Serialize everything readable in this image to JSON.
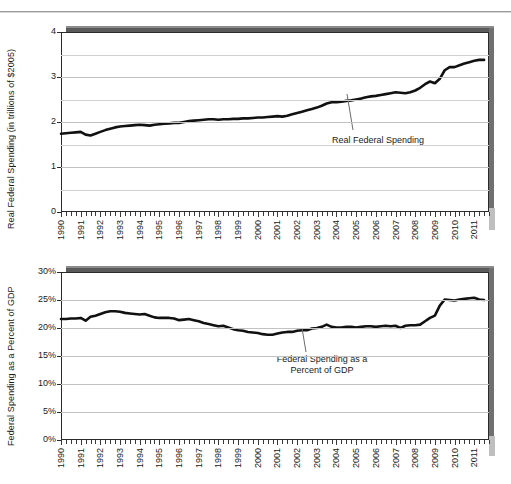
{
  "page": {
    "divider": "horizontal-rule"
  },
  "chart_data": [
    {
      "id": "real-federal-spending",
      "type": "line",
      "title": "",
      "xlabel": "",
      "ylabel": "Real Federal Spending (in trillions of $2005)",
      "ylim": [
        0,
        4
      ],
      "yticks": [
        0,
        1,
        2,
        3,
        4
      ],
      "ytick_labels": [
        "0",
        "1",
        "2",
        "3",
        "4"
      ],
      "gridlines": [
        0.5,
        1,
        1.5,
        2,
        2.5,
        3,
        3.5
      ],
      "grid": true,
      "legend": "none",
      "annotation": "Real Federal Spending",
      "xlim": [
        1990,
        2011.75
      ],
      "xtick_labels": [
        "1990",
        "1991",
        "1992",
        "1993",
        "1994",
        "1995",
        "1996",
        "1997",
        "1998",
        "1999",
        "2000",
        "2001",
        "2002",
        "2003",
        "2004",
        "2005",
        "2006",
        "2007",
        "2008",
        "2009",
        "2010",
        "2011"
      ],
      "minor_ticks_per_year": 4,
      "series": [
        {
          "name": "Real Federal Spending",
          "units": "trillions of 2005 dollars",
          "x": [
            1990.0,
            1990.25,
            1990.5,
            1990.75,
            1991.0,
            1991.25,
            1991.5,
            1991.75,
            1992.0,
            1992.25,
            1992.5,
            1992.75,
            1993.0,
            1993.25,
            1993.5,
            1993.75,
            1994.0,
            1994.25,
            1994.5,
            1994.75,
            1995.0,
            1995.25,
            1995.5,
            1995.75,
            1996.0,
            1996.25,
            1996.5,
            1996.75,
            1997.0,
            1997.25,
            1997.5,
            1997.75,
            1998.0,
            1998.25,
            1998.5,
            1998.75,
            1999.0,
            1999.25,
            1999.5,
            1999.75,
            2000.0,
            2000.25,
            2000.5,
            2000.75,
            2001.0,
            2001.25,
            2001.5,
            2001.75,
            2002.0,
            2002.25,
            2002.5,
            2002.75,
            2003.0,
            2003.25,
            2003.5,
            2003.75,
            2004.0,
            2004.25,
            2004.5,
            2004.75,
            2005.0,
            2005.25,
            2005.5,
            2005.75,
            2006.0,
            2006.25,
            2006.5,
            2006.75,
            2007.0,
            2007.25,
            2007.5,
            2007.75,
            2008.0,
            2008.25,
            2008.5,
            2008.75,
            2009.0,
            2009.25,
            2009.5,
            2009.75,
            2010.0,
            2010.25,
            2010.5,
            2010.75,
            2011.0,
            2011.25,
            2011.5
          ],
          "y": [
            1.74,
            1.75,
            1.76,
            1.77,
            1.78,
            1.72,
            1.7,
            1.74,
            1.78,
            1.82,
            1.85,
            1.88,
            1.9,
            1.91,
            1.92,
            1.93,
            1.94,
            1.93,
            1.92,
            1.94,
            1.95,
            1.96,
            1.97,
            1.98,
            1.98,
            2.0,
            2.02,
            2.03,
            2.04,
            2.05,
            2.06,
            2.06,
            2.05,
            2.06,
            2.06,
            2.07,
            2.07,
            2.08,
            2.08,
            2.09,
            2.1,
            2.1,
            2.11,
            2.12,
            2.13,
            2.12,
            2.14,
            2.17,
            2.2,
            2.23,
            2.26,
            2.29,
            2.32,
            2.36,
            2.41,
            2.44,
            2.44,
            2.45,
            2.47,
            2.48,
            2.5,
            2.52,
            2.55,
            2.57,
            2.58,
            2.6,
            2.62,
            2.64,
            2.66,
            2.65,
            2.64,
            2.66,
            2.7,
            2.76,
            2.84,
            2.9,
            2.86,
            2.96,
            3.15,
            3.22,
            3.22,
            3.26,
            3.3,
            3.33,
            3.36,
            3.38,
            3.38
          ]
        }
      ]
    },
    {
      "id": "federal-spending-percent-gdp",
      "type": "line",
      "title": "",
      "xlabel": "",
      "ylabel": "Federal Spending as a Percent of GDP",
      "ylim": [
        0,
        30
      ],
      "yticks": [
        0,
        5,
        10,
        15,
        20,
        25,
        30
      ],
      "ytick_labels": [
        "0%",
        "5%",
        "10%",
        "15%",
        "20%",
        "25%",
        "30%"
      ],
      "gridlines": [
        5,
        10,
        15,
        20,
        25
      ],
      "grid": true,
      "legend": "none",
      "annotation_line1": "Federal Spending as a",
      "annotation_line2": "Percent of GDP",
      "xlim": [
        1990,
        2011.75
      ],
      "xtick_labels": [
        "1990",
        "1991",
        "1992",
        "1993",
        "1994",
        "1995",
        "1996",
        "1997",
        "1998",
        "1999",
        "2000",
        "2001",
        "2002",
        "2003",
        "2004",
        "2005",
        "2006",
        "2007",
        "2008",
        "2009",
        "2010",
        "2011"
      ],
      "minor_ticks_per_year": 4,
      "series": [
        {
          "name": "Federal Spending as a Percent of GDP",
          "units": "percent of GDP",
          "x": [
            1990.0,
            1990.25,
            1990.5,
            1990.75,
            1991.0,
            1991.25,
            1991.5,
            1991.75,
            1992.0,
            1992.25,
            1992.5,
            1992.75,
            1993.0,
            1993.25,
            1993.5,
            1993.75,
            1994.0,
            1994.25,
            1994.5,
            1994.75,
            1995.0,
            1995.25,
            1995.5,
            1995.75,
            1996.0,
            1996.25,
            1996.5,
            1996.75,
            1997.0,
            1997.25,
            1997.5,
            1997.75,
            1998.0,
            1998.25,
            1998.5,
            1998.75,
            1999.0,
            1999.25,
            1999.5,
            1999.75,
            2000.0,
            2000.25,
            2000.5,
            2000.75,
            2001.0,
            2001.25,
            2001.5,
            2001.75,
            2002.0,
            2002.25,
            2002.5,
            2002.75,
            2003.0,
            2003.25,
            2003.5,
            2003.75,
            2004.0,
            2004.25,
            2004.5,
            2004.75,
            2005.0,
            2005.25,
            2005.5,
            2005.75,
            2006.0,
            2006.25,
            2006.5,
            2006.75,
            2007.0,
            2007.25,
            2007.5,
            2007.75,
            2008.0,
            2008.25,
            2008.5,
            2008.75,
            2009.0,
            2009.25,
            2009.5,
            2009.75,
            2010.0,
            2010.25,
            2010.5,
            2010.75,
            2011.0,
            2011.25,
            2011.5
          ],
          "y": [
            21.6,
            21.6,
            21.7,
            21.7,
            21.8,
            21.3,
            22.0,
            22.2,
            22.5,
            22.8,
            23.0,
            23.0,
            22.9,
            22.7,
            22.6,
            22.5,
            22.4,
            22.5,
            22.2,
            21.9,
            21.8,
            21.8,
            21.8,
            21.7,
            21.4,
            21.5,
            21.6,
            21.4,
            21.2,
            20.9,
            20.7,
            20.5,
            20.3,
            20.4,
            20.1,
            19.8,
            19.6,
            19.5,
            19.3,
            19.2,
            19.1,
            18.9,
            18.8,
            18.8,
            19.0,
            19.2,
            19.3,
            19.3,
            19.5,
            19.6,
            19.6,
            19.9,
            20.0,
            20.2,
            20.6,
            20.2,
            20.1,
            20.1,
            20.2,
            20.2,
            20.1,
            20.2,
            20.3,
            20.3,
            20.2,
            20.3,
            20.4,
            20.3,
            20.4,
            20.0,
            20.4,
            20.5,
            20.5,
            20.6,
            21.2,
            21.8,
            22.2,
            24.0,
            25.1,
            25.0,
            24.9,
            25.1,
            25.2,
            25.3,
            25.4,
            25.1,
            25.0
          ]
        }
      ]
    }
  ]
}
